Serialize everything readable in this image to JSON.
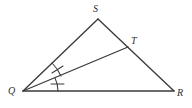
{
  "figure": {
    "type": "geometry-diagram",
    "background_color": "#ffffff",
    "stroke_color": "#3a3a3a",
    "width": 192,
    "height": 108,
    "labels": {
      "apex": "S",
      "cevian_point": "T",
      "left_base": "Q",
      "right_base": "R"
    },
    "points": {
      "S": {
        "x": 98,
        "y": 19
      },
      "T": {
        "x": 128,
        "y": 47
      },
      "Q": {
        "x": 23,
        "y": 91
      },
      "R": {
        "x": 174,
        "y": 91
      }
    },
    "segments": [
      {
        "name": "QS",
        "from": "Q",
        "to": "S"
      },
      {
        "name": "SR",
        "from": "S",
        "to": "R"
      },
      {
        "name": "QR",
        "from": "Q",
        "to": "R"
      },
      {
        "name": "QT",
        "from": "Q",
        "to": "T"
      }
    ],
    "angle_marks": [
      {
        "name": "angle-SQT",
        "ticks": 1,
        "between": [
          "QS",
          "QT"
        ]
      },
      {
        "name": "angle-TQR",
        "ticks": 1,
        "between": [
          "QT",
          "QR"
        ]
      }
    ]
  }
}
